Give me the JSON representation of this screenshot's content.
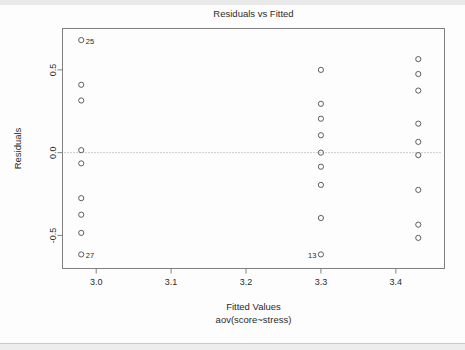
{
  "chart_data": {
    "type": "scatter",
    "title": "Residuals vs Fitted",
    "xlabel": "Fitted Values",
    "xlabel_sub": "aov(score~stress)",
    "ylabel": "Residuals",
    "xlim": [
      2.955,
      3.465
    ],
    "ylim": [
      -0.7,
      0.75
    ],
    "xticks": [
      3.0,
      3.1,
      3.2,
      3.3,
      3.4
    ],
    "xtick_labels": [
      "3.0",
      "3.1",
      "3.2",
      "3.3",
      "3.4"
    ],
    "yticks": [
      0.5,
      0.0,
      -0.5
    ],
    "ytick_labels": [
      "0.5",
      "0.0",
      "-0.5"
    ],
    "grid": false,
    "legend": false,
    "reference_line": {
      "y": 0.0,
      "style": "dashed",
      "color": "#9a9a9a"
    },
    "marker": {
      "shape": "circle-open",
      "color": "#4d4d4d",
      "radius": 2.6
    },
    "point_color": "#4d4d4d",
    "axis_color": "#808080",
    "series": [
      {
        "name": "residuals",
        "points": [
          {
            "x": 2.98,
            "y": 0.68,
            "label": "25"
          },
          {
            "x": 2.98,
            "y": 0.41,
            "label": ""
          },
          {
            "x": 2.98,
            "y": 0.315,
            "label": ""
          },
          {
            "x": 2.98,
            "y": 0.015,
            "label": ""
          },
          {
            "x": 2.98,
            "y": -0.065,
            "label": ""
          },
          {
            "x": 2.98,
            "y": -0.275,
            "label": ""
          },
          {
            "x": 2.98,
            "y": -0.375,
            "label": ""
          },
          {
            "x": 2.98,
            "y": -0.485,
            "label": ""
          },
          {
            "x": 2.98,
            "y": -0.615,
            "label": "27"
          },
          {
            "x": 3.3,
            "y": 0.5,
            "label": ""
          },
          {
            "x": 3.3,
            "y": 0.295,
            "label": ""
          },
          {
            "x": 3.3,
            "y": 0.205,
            "label": ""
          },
          {
            "x": 3.3,
            "y": 0.105,
            "label": ""
          },
          {
            "x": 3.3,
            "y": 0.0,
            "label": ""
          },
          {
            "x": 3.3,
            "y": -0.085,
            "label": ""
          },
          {
            "x": 3.3,
            "y": -0.195,
            "label": ""
          },
          {
            "x": 3.3,
            "y": -0.395,
            "label": ""
          },
          {
            "x": 3.3,
            "y": -0.615,
            "label": "13"
          },
          {
            "x": 3.43,
            "y": 0.565,
            "label": ""
          },
          {
            "x": 3.43,
            "y": 0.475,
            "label": ""
          },
          {
            "x": 3.43,
            "y": 0.375,
            "label": ""
          },
          {
            "x": 3.43,
            "y": 0.175,
            "label": ""
          },
          {
            "x": 3.43,
            "y": 0.065,
            "label": ""
          },
          {
            "x": 3.43,
            "y": -0.015,
            "label": ""
          },
          {
            "x": 3.43,
            "y": -0.225,
            "label": ""
          },
          {
            "x": 3.43,
            "y": -0.435,
            "label": ""
          },
          {
            "x": 3.43,
            "y": -0.515,
            "label": ""
          }
        ]
      }
    ],
    "annotations": [
      {
        "text": "25",
        "x": 2.98,
        "y": 0.68,
        "side": "right"
      },
      {
        "text": "27",
        "x": 2.98,
        "y": -0.615,
        "side": "right"
      },
      {
        "text": "13",
        "x": 3.3,
        "y": -0.615,
        "side": "left"
      }
    ]
  }
}
